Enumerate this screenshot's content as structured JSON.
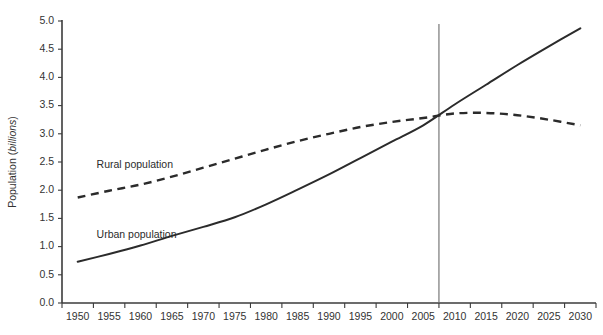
{
  "chart_data": {
    "type": "line",
    "title": "",
    "xlabel": "",
    "ylabel": "Population (billions)",
    "ylabel_plain": "Population (",
    "ylabel_italic": "billions",
    "ylabel_tail": ")",
    "xlim": [
      1950,
      2030
    ],
    "ylim": [
      0.0,
      5.0
    ],
    "grid": false,
    "legend_position": "inline-annotation",
    "x": [
      1950,
      1955,
      1960,
      1965,
      1970,
      1975,
      1980,
      1985,
      1990,
      1995,
      2000,
      2005,
      2010,
      2015,
      2020,
      2025,
      2030
    ],
    "xticklabels": [
      "1950",
      "1955",
      "1960",
      "1965",
      "1970",
      "1975",
      "1980",
      "1985",
      "1990",
      "1995",
      "2000",
      "2005",
      "2010",
      "2015",
      "2020",
      "2025",
      "2030"
    ],
    "yticks": [
      0.0,
      0.5,
      1.0,
      1.5,
      2.0,
      2.5,
      3.0,
      3.5,
      4.0,
      4.5,
      5.0
    ],
    "yticklabels": [
      "0.0",
      "0.5",
      "1.0",
      "1.5",
      "2.0",
      "2.5",
      "3.0",
      "3.5",
      "4.0",
      "4.5",
      "5.0"
    ],
    "series": [
      {
        "name": "Urban population",
        "label": "Urban population",
        "style": "solid",
        "color": "#2b2b2b",
        "values": [
          0.73,
          0.87,
          1.02,
          1.19,
          1.35,
          1.52,
          1.75,
          2.01,
          2.28,
          2.57,
          2.86,
          3.15,
          3.52,
          3.87,
          4.22,
          4.55,
          4.87
        ]
      },
      {
        "name": "Rural population",
        "label": "Rural population",
        "style": "dashed",
        "color": "#2b2b2b",
        "values": [
          1.87,
          1.99,
          2.1,
          2.24,
          2.4,
          2.56,
          2.72,
          2.87,
          3.0,
          3.12,
          3.21,
          3.28,
          3.36,
          3.37,
          3.33,
          3.25,
          3.15
        ]
      }
    ],
    "annotations": [
      {
        "name": "reference-line",
        "type": "vline",
        "x": 2007.5,
        "y_top": 5.0,
        "y_bottom": 0.0,
        "color": "#6b6b6b"
      },
      {
        "name": "rural-label",
        "text": "Rural population",
        "x": 1953,
        "y": 2.4
      },
      {
        "name": "urban-label",
        "text": "Urban population",
        "x": 1953,
        "y": 1.16
      }
    ]
  }
}
